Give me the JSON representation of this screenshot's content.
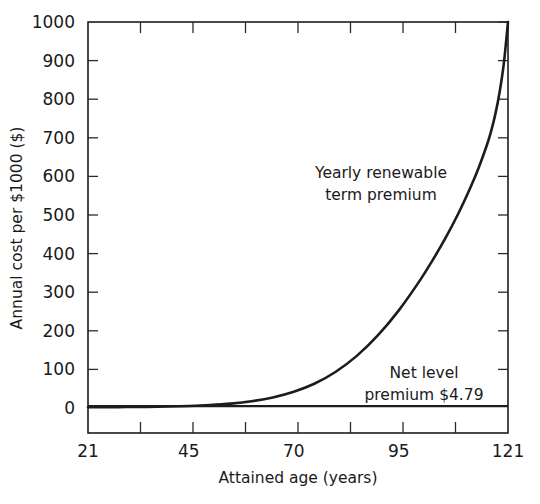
{
  "chart_data": {
    "type": "line",
    "title": "",
    "xlabel": "Attained age (years)",
    "ylabel": "Annual cost per $1000 ($)",
    "xlim": [
      21,
      121
    ],
    "ylim": [
      0,
      1000
    ],
    "grid": false,
    "legend_position": "none",
    "x_ticks_labeled": [
      "21",
      "45",
      "70",
      "95",
      "121"
    ],
    "x_tick_values": [
      21,
      45,
      70,
      95,
      121
    ],
    "x_minor_tick_count": 4,
    "y_ticks_labeled": [
      "0",
      "100",
      "200",
      "300",
      "400",
      "500",
      "600",
      "700",
      "800",
      "900",
      "1000"
    ],
    "y_tick_values": [
      0,
      100,
      200,
      300,
      400,
      500,
      600,
      700,
      800,
      900,
      1000
    ],
    "series": [
      {
        "name": "Yearly renewable term premium",
        "x": [
          21,
          25,
          30,
          35,
          40,
          45,
          50,
          55,
          60,
          65,
          70,
          75,
          80,
          85,
          90,
          95,
          100,
          103,
          106,
          109,
          112,
          114,
          116,
          117,
          118,
          119,
          120,
          121
        ],
        "values": [
          1.8,
          2.0,
          2.4,
          3.0,
          3.9,
          5.3,
          7.6,
          11.4,
          17.6,
          27.3,
          42.0,
          63.5,
          94.0,
          135.0,
          188.0,
          253.0,
          330.0,
          382.0,
          438.0,
          500.0,
          570.0,
          622.0,
          682.0,
          718.0,
          762.0,
          818.0,
          892.0,
          1000.0
        ]
      },
      {
        "name": "Net level premium $4.79",
        "x": [
          21,
          121
        ],
        "values": [
          4.79,
          4.79
        ]
      }
    ],
    "annotations": [
      {
        "name": "yearly-renewable-term-premium-label",
        "line1": "Yearly renewable",
        "line2": "term premium",
        "x_px": 381,
        "y_px": 178
      },
      {
        "name": "net-level-premium-label",
        "line1": "Net level",
        "line2": "premium $4.79",
        "x_px": 424,
        "y_px": 378
      }
    ],
    "colors": {
      "curve": "#1c1c1c",
      "axis": "#1c1c1c",
      "text": "#1a1a1a",
      "background": "#ffffff"
    }
  }
}
